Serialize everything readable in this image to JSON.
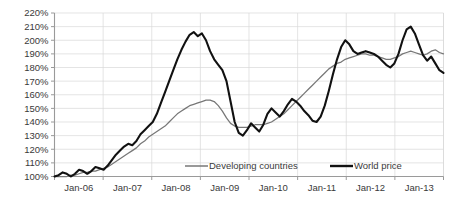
{
  "chart_data": {
    "type": "line",
    "title": "",
    "subtitle": "",
    "xlabel": "",
    "ylabel": "",
    "ylim": [
      100,
      220
    ],
    "ytick_labels": [
      "100%",
      "110%",
      "120%",
      "130%",
      "140%",
      "150%",
      "160%",
      "170%",
      "180%",
      "190%",
      "200%",
      "210%",
      "220%"
    ],
    "ytick_values": [
      100,
      110,
      120,
      130,
      140,
      150,
      160,
      170,
      180,
      190,
      200,
      210,
      220
    ],
    "xtick_labels": [
      "Jan-06",
      "Jan-07",
      "Jan-08",
      "Jan-09",
      "Jan-10",
      "Jan-11",
      "Jan-12",
      "Jan-13"
    ],
    "x_start": "Jan-06",
    "x_end": "Dec-13",
    "x_count": 96,
    "grid": true,
    "grid_horizontal": true,
    "grid_vertical": true,
    "legend_position": "bottom-center-inside",
    "legend_entries": [
      "Developing countries",
      "World price"
    ],
    "series": [
      {
        "name": "Developing countries",
        "color": "#777777",
        "style": "thin-gray-line",
        "values": [
          100,
          100,
          100,
          100,
          101,
          101,
          102,
          103,
          103,
          104,
          104,
          105,
          106,
          107,
          109,
          111,
          113,
          115,
          117,
          119,
          121,
          124,
          126,
          129,
          131,
          133,
          135,
          137,
          140,
          143,
          146,
          148,
          150,
          152,
          153,
          154,
          155,
          156,
          156,
          155,
          152,
          148,
          143,
          139,
          137,
          136,
          136,
          136,
          137,
          138,
          138,
          138,
          139,
          140,
          142,
          144,
          146,
          149,
          152,
          155,
          158,
          161,
          164,
          167,
          170,
          173,
          176,
          179,
          181,
          183,
          184,
          186,
          187,
          188,
          189,
          190,
          190,
          189,
          189,
          188,
          187,
          186,
          186,
          187,
          188,
          190,
          191,
          192,
          191,
          190,
          189,
          190,
          192,
          193,
          191,
          190
        ]
      },
      {
        "name": "World price",
        "color": "#111111",
        "style": "thick-black-line",
        "values": [
          100,
          101,
          103,
          102,
          100,
          102,
          105,
          104,
          102,
          104,
          107,
          106,
          105,
          108,
          112,
          116,
          119,
          122,
          124,
          123,
          126,
          131,
          134,
          137,
          140,
          146,
          154,
          162,
          170,
          178,
          186,
          193,
          199,
          204,
          206,
          203,
          205,
          200,
          192,
          186,
          182,
          178,
          170,
          155,
          140,
          132,
          130,
          134,
          139,
          136,
          133,
          138,
          146,
          150,
          147,
          144,
          148,
          153,
          157,
          155,
          152,
          148,
          145,
          141,
          140,
          144,
          152,
          163,
          175,
          186,
          195,
          200,
          197,
          192,
          190,
          191,
          192,
          191,
          190,
          188,
          185,
          182,
          180,
          183,
          190,
          200,
          208,
          210,
          205,
          197,
          189,
          185,
          188,
          183,
          178,
          176
        ]
      }
    ]
  },
  "axis": {
    "y_unit": "%",
    "x_unit": "month"
  }
}
